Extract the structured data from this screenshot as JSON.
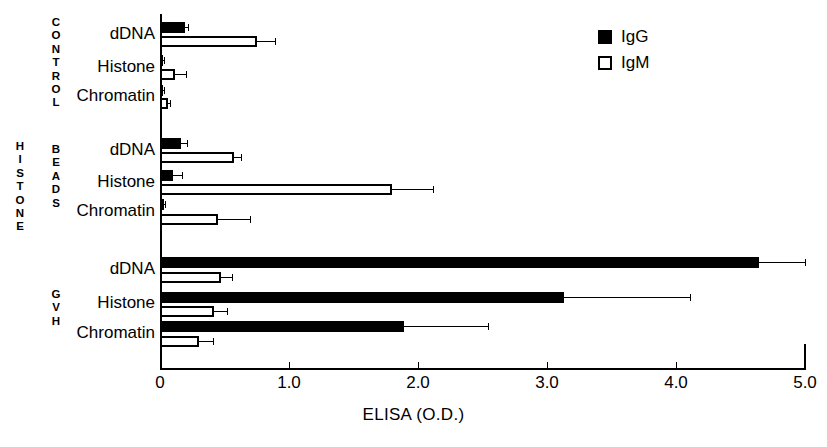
{
  "chart_data": {
    "type": "bar",
    "orientation": "horizontal",
    "title": "",
    "xlabel": "ELISA  (O.D.)",
    "ylabel": "",
    "xlim": [
      0,
      5.0
    ],
    "xticks": [
      0,
      1.0,
      2.0,
      3.0,
      4.0,
      5.0
    ],
    "xticklabels": [
      "0",
      "1.0",
      "2.0",
      "3.0",
      "4.0",
      "5.0"
    ],
    "grid": false,
    "legend": {
      "position": "top-right",
      "entries": [
        {
          "label": "IgG",
          "marker": "filled-square",
          "color": "#000000"
        },
        {
          "label": "IgM",
          "marker": "open-square",
          "color": "#ffffff"
        }
      ]
    },
    "outer_group_label": "HISTONE",
    "groups": [
      {
        "name": "CONTROL",
        "categories": [
          "dDNA",
          "Histone",
          "Chromatin"
        ],
        "series": [
          {
            "name": "IgG",
            "values": [
              0.19,
              0.02,
              0.02
            ],
            "errors": [
              0.03,
              0.01,
              0.01
            ]
          },
          {
            "name": "IgM",
            "values": [
              0.75,
              0.12,
              0.06
            ],
            "errors": [
              0.14,
              0.08,
              0.02
            ]
          }
        ]
      },
      {
        "name": "BEADS",
        "categories": [
          "dDNA",
          "Histone",
          "Chromatin"
        ],
        "series": [
          {
            "name": "IgG",
            "values": [
              0.16,
              0.1,
              0.03
            ],
            "errors": [
              0.05,
              0.07,
              0.01
            ]
          },
          {
            "name": "IgM",
            "values": [
              0.57,
              1.8,
              0.45
            ],
            "errors": [
              0.06,
              0.32,
              0.25
            ]
          }
        ]
      },
      {
        "name": "GVH",
        "categories": [
          "dDNA",
          "Histone",
          "Chromatin"
        ],
        "series": [
          {
            "name": "IgG",
            "values": [
              4.64,
              3.13,
              1.89
            ],
            "errors": [
              0.36,
              0.98,
              0.65
            ]
          },
          {
            "name": "IgM",
            "values": [
              0.47,
              0.42,
              0.3
            ],
            "errors": [
              0.09,
              0.1,
              0.11
            ]
          }
        ]
      }
    ]
  },
  "axis": {
    "x_title": "ELISA  (O.D.)",
    "tick_0": "0",
    "tick_1": "1.0",
    "tick_2": "2.0",
    "tick_3": "3.0",
    "tick_4": "4.0",
    "tick_5": "5.0"
  },
  "labels": {
    "outer": "HISTONE",
    "group_control": "CONTROL",
    "group_beads": "BEADS",
    "group_gvh": "GVH",
    "cat_ddna": "dDNA",
    "cat_histone": "Histone",
    "cat_chromatin": "Chromatin"
  },
  "legend": {
    "igg": "IgG",
    "igm": "IgM"
  }
}
